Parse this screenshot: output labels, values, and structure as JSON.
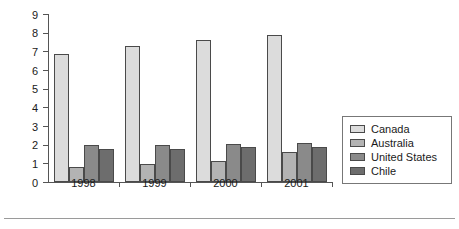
{
  "chart_data": {
    "type": "bar",
    "title": "",
    "xlabel": "",
    "ylabel": "",
    "categories": [
      "1998",
      "1999",
      "2000",
      "2001"
    ],
    "series": [
      {
        "name": "Canada",
        "color": "#dcdcdc",
        "values": [
          6.85,
          7.3,
          7.6,
          7.9
        ]
      },
      {
        "name": "Australia",
        "color": "#b3b3b3",
        "values": [
          0.8,
          0.95,
          1.15,
          1.6
        ]
      },
      {
        "name": "United States",
        "color": "#8a8a8a",
        "values": [
          2.0,
          2.0,
          2.05,
          2.1
        ]
      },
      {
        "name": "Chile",
        "color": "#6d6d6d",
        "values": [
          1.75,
          1.75,
          1.9,
          1.9
        ]
      }
    ],
    "ylim": [
      0,
      9
    ],
    "ytick_labels": [
      "0",
      "1",
      "2",
      "3",
      "4",
      "5",
      "6",
      "7",
      "8",
      "9"
    ],
    "yticks": [
      0,
      1,
      2,
      3,
      4,
      5,
      6,
      7,
      8,
      9
    ],
    "grid": false,
    "legend_position": "right"
  }
}
